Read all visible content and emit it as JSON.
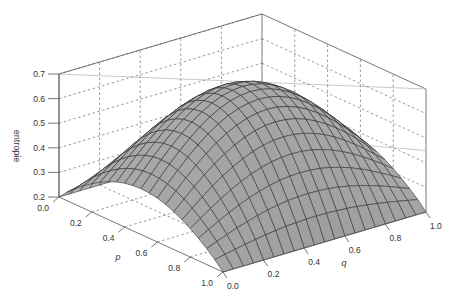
{
  "chart_data": {
    "type": "surface3d",
    "title": "",
    "xlabel": "p",
    "ylabel": "q",
    "zlabel": "entropie",
    "xlim": [
      0.0,
      1.0
    ],
    "ylim": [
      0.0,
      1.0
    ],
    "zlim": [
      0.2,
      0.7
    ],
    "x_ticks": [
      "0.0",
      "0.2",
      "0.4",
      "0.6",
      "0.8",
      "1.0"
    ],
    "y_ticks": [
      "0.0",
      "0.2",
      "0.4",
      "0.6",
      "0.8",
      "1.0"
    ],
    "z_ticks": [
      "0.2",
      "0.3",
      "0.4",
      "0.5",
      "0.6",
      "0.7"
    ],
    "grid": true,
    "surface_color": "#a9a9a9",
    "mesh_color": "#333333",
    "surface_model": "z = 0.2 + 0.48 * sin(pi*p)^0.9 * sin(pi*(0.15+0.7*q))^1.2  (approximate fit, peak ~0.68 near p=0.5,q=0.5)",
    "grid_resolution": 21,
    "z_peak": 0.68
  },
  "labels": {
    "z_axis_title": "entropie",
    "x_axis_title": "p",
    "y_axis_title": "q"
  }
}
